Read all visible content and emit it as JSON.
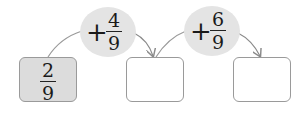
{
  "diagram": {
    "start": {
      "numerator": "2",
      "denominator": "9"
    },
    "steps": [
      {
        "operator": "+",
        "numerator": "4",
        "denominator": "9"
      },
      {
        "operator": "+",
        "numerator": "6",
        "denominator": "9"
      }
    ],
    "answer_boxes": [
      "",
      ""
    ],
    "colors": {
      "start_fill": "#dcdcdc",
      "ellipse_fill": "#e4e4e4",
      "border": "#9a9a9a",
      "arrow": "#8a8a8a"
    }
  }
}
